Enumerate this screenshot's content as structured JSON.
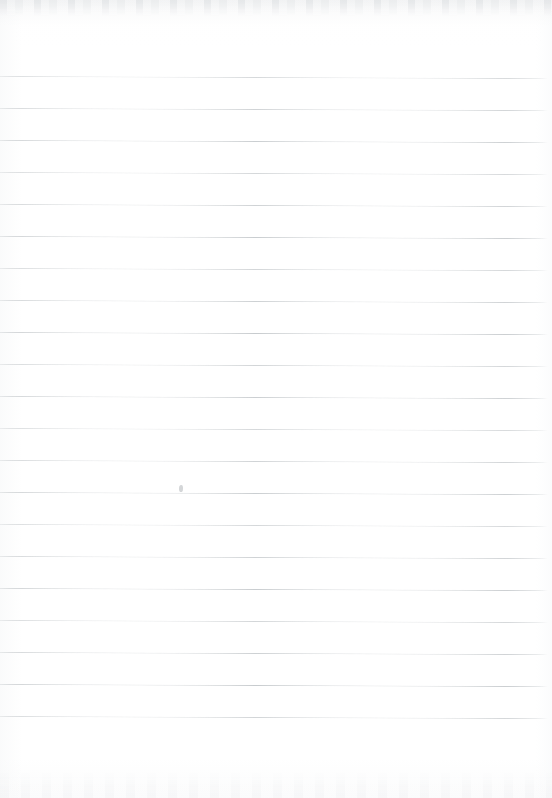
{
  "document": {
    "type": "scanned-lined-paper",
    "title": "Blank Ruled Notebook Page",
    "description": "Scanned blank sheet of ruled/lined writing paper with no handwriting or printed text",
    "page_width": 552,
    "page_height": 798,
    "background_color": "#ffffff",
    "written_content": "",
    "text_lines": []
  },
  "ruling": {
    "line_color": "#c6cacd",
    "line_thickness": 1,
    "line_count": 21,
    "line_spacing": 32,
    "first_line_y": 76,
    "last_line_y": 716,
    "line_left_x": 0,
    "line_right_x": 548,
    "skew_degrees": 0.22,
    "top_margin": 76,
    "bottom_margin": 82,
    "lines_y": [
      76,
      108,
      140,
      172,
      204,
      236,
      268,
      300,
      332,
      364,
      396,
      428,
      460,
      492,
      524,
      556,
      588,
      620,
      652,
      684,
      716
    ]
  },
  "artifacts": {
    "top_scan_shadow": true,
    "bottom_scan_grain": true,
    "pencil_smudge": {
      "x": 179,
      "y": 485,
      "visible": true
    }
  }
}
